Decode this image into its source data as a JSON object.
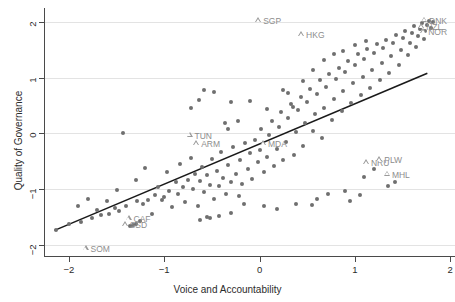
{
  "chart_data": {
    "type": "scatter",
    "title": "",
    "xlabel": "Voice and Accountability",
    "ylabel": "Quality of Governance",
    "xlim": [
      -2.25,
      2.05
    ],
    "ylim": [
      -2.2,
      2.25
    ],
    "xticks": [
      -2,
      -1,
      0,
      1,
      2
    ],
    "yticks": [
      -2,
      -1,
      0,
      1,
      2
    ],
    "xticklabels": [
      "−2",
      "−1",
      "0",
      "1",
      "2"
    ],
    "yticklabels": [
      "−2",
      "−1",
      "0",
      "1",
      "2"
    ],
    "grid": "horizontal",
    "legend": "none",
    "series": [
      {
        "name": "countries",
        "marker": "filled-circle",
        "color": "#6f6f6f",
        "points": [
          [
            -2.13,
            -1.74
          ],
          [
            -2.0,
            -1.63
          ],
          [
            -1.87,
            -1.59
          ],
          [
            -1.8,
            -1.18
          ],
          [
            -1.76,
            -1.52
          ],
          [
            -1.7,
            -1.38
          ],
          [
            -1.66,
            -1.46
          ],
          [
            -1.58,
            -1.44
          ],
          [
            -1.52,
            -1.34
          ],
          [
            -1.5,
            -1.01
          ],
          [
            -1.47,
            -1.4
          ],
          [
            -1.43,
            0.0
          ],
          [
            -1.4,
            -1.3
          ],
          [
            -1.33,
            -1.64
          ],
          [
            -1.3,
            -0.83
          ],
          [
            -1.28,
            -1.22
          ],
          [
            -1.25,
            -1.57
          ],
          [
            -1.22,
            -1.27
          ],
          [
            -1.2,
            -0.62
          ],
          [
            -1.17,
            -1.19
          ],
          [
            -1.13,
            -1.45
          ],
          [
            -1.1,
            -1.1
          ],
          [
            -1.06,
            -0.97
          ],
          [
            -1.02,
            -1.2
          ],
          [
            -1.0,
            -1.14
          ],
          [
            -0.97,
            -0.7
          ],
          [
            -0.95,
            -1.03
          ],
          [
            -0.92,
            -1.32
          ],
          [
            -0.88,
            -0.88
          ],
          [
            -0.85,
            -1.09
          ],
          [
            -0.83,
            -0.55
          ],
          [
            -0.8,
            -0.97
          ],
          [
            -0.78,
            -1.23
          ],
          [
            -0.75,
            -0.83
          ],
          [
            -0.72,
            -0.44
          ],
          [
            -0.7,
            -1.0
          ],
          [
            -0.68,
            -0.72
          ],
          [
            -0.65,
            -1.3
          ],
          [
            -0.62,
            -0.86
          ],
          [
            -0.6,
            -0.6
          ],
          [
            -0.58,
            -1.05
          ],
          [
            -0.55,
            -0.75
          ],
          [
            -0.52,
            -0.92
          ],
          [
            -0.5,
            -0.46
          ],
          [
            -0.48,
            -1.18
          ],
          [
            -0.45,
            -0.68
          ],
          [
            -0.43,
            -0.95
          ],
          [
            -0.4,
            -0.33
          ],
          [
            -0.38,
            -0.8
          ],
          [
            -0.35,
            -1.08
          ],
          [
            -0.33,
            -0.57
          ],
          [
            -0.3,
            -0.88
          ],
          [
            -0.28,
            -0.25
          ],
          [
            -0.25,
            -0.72
          ],
          [
            -0.22,
            -1.12
          ],
          [
            -0.2,
            -0.48
          ],
          [
            -0.18,
            -0.9
          ],
          [
            -0.15,
            -0.18
          ],
          [
            -0.12,
            -0.64
          ],
          [
            -0.1,
            -0.36
          ],
          [
            -0.08,
            -0.82
          ],
          [
            -0.05,
            -0.12
          ],
          [
            -0.02,
            -0.52
          ],
          [
            0.0,
            -0.3
          ],
          [
            0.02,
            0.08
          ],
          [
            0.05,
            -0.7
          ],
          [
            0.08,
            -0.42
          ],
          [
            0.1,
            -0.02
          ],
          [
            0.13,
            0.22
          ],
          [
            0.15,
            -0.58
          ],
          [
            0.18,
            -0.28
          ],
          [
            0.2,
            0.12
          ],
          [
            0.22,
            0.38
          ],
          [
            0.25,
            -0.48
          ],
          [
            0.28,
            -0.15
          ],
          [
            0.3,
            0.28
          ],
          [
            0.33,
            0.52
          ],
          [
            0.36,
            -0.38
          ],
          [
            0.38,
            0.02
          ],
          [
            0.4,
            0.42
          ],
          [
            0.43,
            0.66
          ],
          [
            0.46,
            -0.22
          ],
          [
            0.48,
            0.18
          ],
          [
            0.5,
            0.56
          ],
          [
            0.53,
            0.8
          ],
          [
            0.56,
            0.05
          ],
          [
            0.58,
            0.34
          ],
          [
            0.6,
            0.7
          ],
          [
            0.63,
            0.95
          ],
          [
            0.66,
            -0.08
          ],
          [
            0.68,
            0.46
          ],
          [
            0.7,
            0.84
          ],
          [
            0.73,
            1.06
          ],
          [
            0.76,
            0.24
          ],
          [
            0.78,
            0.62
          ],
          [
            0.8,
            0.98
          ],
          [
            0.83,
            1.18
          ],
          [
            0.86,
            0.4
          ],
          [
            0.88,
            0.76
          ],
          [
            0.9,
            1.1
          ],
          [
            0.93,
            1.3
          ],
          [
            0.96,
            0.55
          ],
          [
            0.98,
            0.9
          ],
          [
            1.0,
            1.22
          ],
          [
            1.03,
            1.42
          ],
          [
            1.06,
            0.68
          ],
          [
            1.08,
            1.02
          ],
          [
            1.1,
            1.34
          ],
          [
            1.13,
            1.52
          ],
          [
            1.16,
            0.82
          ],
          [
            1.18,
            1.14
          ],
          [
            1.2,
            1.44
          ],
          [
            1.23,
            1.6
          ],
          [
            1.26,
            0.95
          ],
          [
            1.28,
            1.26
          ],
          [
            1.3,
            1.54
          ],
          [
            1.33,
            1.68
          ],
          [
            1.36,
            1.08
          ],
          [
            1.38,
            1.38
          ],
          [
            1.4,
            1.62
          ],
          [
            1.43,
            1.76
          ],
          [
            1.46,
            1.22
          ],
          [
            1.48,
            1.5
          ],
          [
            1.5,
            1.72
          ],
          [
            1.53,
            1.84
          ],
          [
            1.56,
            1.4
          ],
          [
            1.58,
            1.62
          ],
          [
            1.6,
            1.8
          ],
          [
            1.62,
            1.92
          ],
          [
            1.64,
            1.55
          ],
          [
            1.66,
            1.74
          ],
          [
            1.68,
            1.88
          ],
          [
            1.7,
            1.98
          ],
          [
            1.72,
            1.7
          ],
          [
            1.74,
            1.84
          ],
          [
            1.76,
            1.95
          ],
          [
            1.78,
            2.02
          ],
          [
            1.8,
            1.9
          ],
          [
            1.82,
            1.99
          ],
          [
            -0.42,
            -1.48
          ],
          [
            -0.3,
            -1.42
          ],
          [
            0.05,
            -1.3
          ],
          [
            0.18,
            -1.36
          ],
          [
            0.38,
            -1.26
          ],
          [
            0.55,
            -1.28
          ],
          [
            0.72,
            -1.08
          ],
          [
            0.95,
            -1.22
          ],
          [
            1.1,
            -0.78
          ],
          [
            1.2,
            -0.64
          ],
          [
            1.35,
            -0.95
          ],
          [
            -0.62,
            -1.55
          ],
          [
            -0.55,
            -1.5
          ],
          [
            -0.52,
            -1.52
          ],
          [
            -0.16,
            -1.26
          ],
          [
            0.6,
            -1.18
          ],
          [
            0.25,
            0.78
          ],
          [
            0.3,
            0.72
          ],
          [
            0.35,
            0.48
          ],
          [
            -0.72,
            0.46
          ],
          [
            -0.64,
            0.6
          ],
          [
            -0.58,
            0.78
          ],
          [
            -0.48,
            0.74
          ],
          [
            -0.3,
            0.56
          ],
          [
            -0.23,
            0.22
          ],
          [
            -0.36,
            0.18
          ],
          [
            -0.33,
            0.08
          ],
          [
            -0.1,
            0.58
          ],
          [
            0.08,
            0.44
          ],
          [
            0.46,
            0.94
          ],
          [
            0.56,
            1.14
          ],
          [
            0.68,
            1.32
          ],
          [
            0.78,
            1.42
          ],
          [
            0.88,
            1.48
          ],
          [
            1.0,
            1.58
          ],
          [
            1.12,
            1.66
          ],
          [
            -1.36,
            -1.66
          ],
          [
            -1.3,
            -1.62
          ],
          [
            0.9,
            -1.04
          ],
          [
            1.05,
            -1.1
          ],
          [
            1.42,
            -0.88
          ],
          [
            -1.9,
            -1.3
          ],
          [
            -1.6,
            -1.22
          ]
        ]
      }
    ],
    "fit_line": {
      "style": "solid",
      "color": "#1a1a1a",
      "x_start": -2.15,
      "y_start": -1.74,
      "x_end": 1.76,
      "y_end": 1.08
    },
    "labeled_points": [
      {
        "code": "SGP",
        "x": -0.01,
        "y": 2.03,
        "label_side": "right"
      },
      {
        "code": "HKG",
        "x": 0.44,
        "y": 1.78,
        "label_side": "right"
      },
      {
        "code": "DNK",
        "x": 1.73,
        "y": 2.04,
        "label_side": "right"
      },
      {
        "code": "NZL",
        "x": 1.7,
        "y": 1.92,
        "label_side": "right"
      },
      {
        "code": "NOR",
        "x": 1.72,
        "y": 1.83,
        "label_side": "right"
      },
      {
        "code": "TUN",
        "x": -0.73,
        "y": -0.02,
        "label_side": "right"
      },
      {
        "code": "ARM",
        "x": -0.66,
        "y": -0.18,
        "label_side": "right"
      },
      {
        "code": "MDA",
        "x": 0.04,
        "y": -0.18,
        "label_side": "right"
      },
      {
        "code": "NRU",
        "x": 1.12,
        "y": -0.52,
        "label_side": "right"
      },
      {
        "code": "PLW",
        "x": 1.26,
        "y": -0.46,
        "label_side": "right"
      },
      {
        "code": "MHL",
        "x": 1.34,
        "y": -0.72,
        "label_side": "right"
      },
      {
        "code": "CAF",
        "x": -1.37,
        "y": -1.52,
        "label_side": "right"
      },
      {
        "code": "SSD",
        "x": -1.41,
        "y": -1.63,
        "label_side": "right"
      },
      {
        "code": "SOM",
        "x": -1.82,
        "y": -2.06,
        "label_side": "right"
      }
    ]
  }
}
